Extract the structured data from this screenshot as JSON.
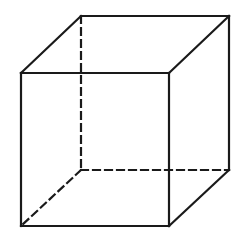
{
  "diagram": {
    "type": "cube-wireframe",
    "stroke_color": "#1a1a1a",
    "background": "#ffffff",
    "stroke_width": 2.2,
    "dash": "7,5",
    "vertices": {
      "front_top_left": [
        21,
        73
      ],
      "front_top_right": [
        169,
        73
      ],
      "front_bottom_left": [
        21,
        226
      ],
      "front_bottom_right": [
        169,
        226
      ],
      "back_top_left": [
        81,
        16
      ],
      "back_top_right": [
        229,
        16
      ],
      "back_bottom_left": [
        81,
        170
      ],
      "back_bottom_right": [
        229,
        170
      ]
    },
    "visible_edges": 9,
    "hidden_edges": 3
  }
}
